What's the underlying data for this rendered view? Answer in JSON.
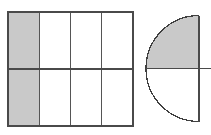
{
  "page": {
    "background_color": "#ffffff",
    "width": 211,
    "height": 135
  },
  "style": {
    "shade_color": "#c9c9c9",
    "unshaded_color": "#ffffff",
    "line_color": "#4a4a4a",
    "thin_line_color": "#555555",
    "outline_width": 1.6,
    "inner_line_width": 1.4,
    "arc_line_width": 1.3
  },
  "figures": [
    {
      "id": "rectangle-grid",
      "shape_name": "rectangle",
      "label": "Rectangle divided into 8 equal parts",
      "geometry": {
        "x": 8,
        "y": 12,
        "width": 125,
        "height": 114,
        "columns": 4,
        "rows": 2
      },
      "column_x": [
        8,
        39.25,
        70.5,
        101.75,
        133
      ],
      "row_y": [
        12,
        69,
        126
      ],
      "total_parts": 8,
      "shaded_parts": 2,
      "fraction": "2/8",
      "cells": [
        {
          "row": 0,
          "col": 0,
          "shaded": true
        },
        {
          "row": 0,
          "col": 1,
          "shaded": false
        },
        {
          "row": 0,
          "col": 2,
          "shaded": false
        },
        {
          "row": 0,
          "col": 3,
          "shaded": false
        },
        {
          "row": 1,
          "col": 0,
          "shaded": true
        },
        {
          "row": 1,
          "col": 1,
          "shaded": false
        },
        {
          "row": 1,
          "col": 2,
          "shaded": false
        },
        {
          "row": 1,
          "col": 3,
          "shaded": false
        }
      ]
    },
    {
      "id": "semicircle",
      "shape_name": "semicircle",
      "label": "Semicircle divided into 2 equal parts",
      "geometry": {
        "center_x": 199,
        "center_y": 68.5,
        "radius": 53,
        "orientation": "left-half",
        "diameter_line_y": 68.5,
        "chord_line_x": 199
      },
      "total_parts": 2,
      "shaded_parts": 1,
      "fraction": "1/2",
      "sectors": [
        {
          "position": "upper-left-quarter",
          "shaded": true
        },
        {
          "position": "lower-left-quarter",
          "shaded": false
        }
      ]
    }
  ]
}
